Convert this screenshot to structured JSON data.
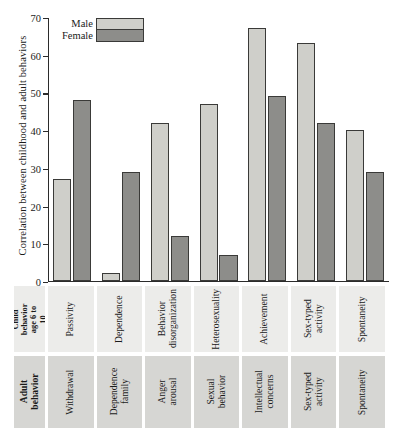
{
  "chart_data": {
    "type": "bar",
    "title": "",
    "xlabel": "",
    "ylabel": "Correlation between childhood and adult behaviors",
    "ylim": [
      0,
      70
    ],
    "yticks": [
      0,
      10,
      20,
      30,
      40,
      50,
      60,
      70
    ],
    "grid": false,
    "legend_position": "top-left",
    "categories": [
      "Passivity",
      "Dependence",
      "Behavior disorganization",
      "Heterosexuality",
      "Achievement",
      "Sex-typed activity",
      "Spontaneity"
    ],
    "series": [
      {
        "name": "Male",
        "values": [
          27,
          2,
          42,
          47,
          67,
          63,
          40
        ]
      },
      {
        "name": "Female",
        "values": [
          48,
          29,
          12,
          7,
          49,
          42,
          29
        ]
      }
    ],
    "colors": {
      "male": "#cfcfca",
      "female": "#8d8d8a",
      "bar_outline": "#3a3a38",
      "axis": "#2b2b2b",
      "child_row_bg": "#ececea",
      "adult_row_bg": "#d6d6d3"
    }
  },
  "legend": {
    "entries": [
      {
        "label": "Male"
      },
      {
        "label": "Female"
      }
    ]
  },
  "table": {
    "child_row": {
      "header": "Child behavior age 6 to 10",
      "cells": [
        "Passivity",
        "Dependence",
        "Behavior disorganization",
        "Heterosexuality",
        "Achievement",
        "Sex-typed activity",
        "Spontaneity"
      ]
    },
    "adult_row": {
      "header": "Adult behavior",
      "cells": [
        "Withdrawal",
        "Dependence family",
        "Anger arousal",
        "Sexual behavior",
        "Intellectual concerns",
        "Sex-typed activity",
        "Spontaneity"
      ]
    }
  }
}
